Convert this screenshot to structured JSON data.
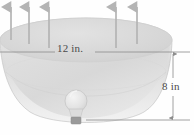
{
  "figure": {
    "kind": "geometry-diagram",
    "labels": {
      "diameter": "12 in.",
      "depth": "8 in"
    },
    "dimensions": {
      "diameter_value": 12,
      "diameter_unit": "in.",
      "depth_value": 8,
      "depth_unit": "in"
    },
    "parts": {
      "bowl_name": "reflector-bowl",
      "bulb_name": "light-bulb",
      "rays_name": "light-rays",
      "diameter_dimension_name": "diameter-dimension-line",
      "depth_dimension_name": "depth-dimension-line"
    },
    "rays": {
      "count": 5,
      "direction": "up",
      "x_positions": [
        11,
        29,
        49,
        116,
        137
      ],
      "top_y": 6,
      "bottom_y": 40
    },
    "colors": {
      "bowl_fill": "#dcdcdc",
      "bowl_fill_light": "#ececec",
      "bowl_rim": "#d2d2d2",
      "outline": "#bdbdbd",
      "ray": "#b8b8b8",
      "dimension_line": "#8c8c8c",
      "text": "#4a4a4a",
      "bulb_glass": "#e6e6e6",
      "bulb_base": "#9a9a9a",
      "background": "#fefefe"
    },
    "geometry": {
      "rim_center_x": 86,
      "rim_center_y": 40,
      "rim_rx": 86,
      "rim_ry": 22,
      "bowl_bottom_y": 122,
      "dim_h_y": 52,
      "dim_v_x": 173,
      "dim_v_top": 52,
      "dim_v_bottom": 120
    }
  }
}
